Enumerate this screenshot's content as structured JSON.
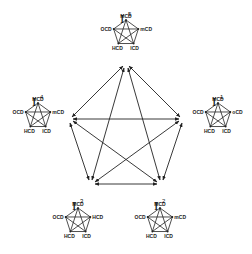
{
  "diagram": {
    "type": "network",
    "colors": {
      "line": "#222222",
      "background": "#ffffff"
    },
    "central_graph": {
      "nodes": [
        "I5",
        "I1",
        "I2",
        "I3",
        "I4"
      ],
      "edges": "all pairs, bidirectional arrows"
    },
    "subgraphs": [
      {
        "id": "I5",
        "title": "I",
        "superscript": "5",
        "labels": {
          "top": "MCD",
          "left": "OCD",
          "right": "mCD",
          "bottom_left": "HCD",
          "bottom_right": "ICD"
        }
      },
      {
        "id": "I4",
        "title": "I",
        "superscript": "4",
        "labels": {
          "top": "MCD",
          "left": "OCD",
          "right": "mCD",
          "bottom_left": "HCD",
          "bottom_right": "ICD"
        }
      },
      {
        "id": "I1",
        "title": "I",
        "superscript": "1",
        "labels": {
          "top": "MCD",
          "left": "OCD",
          "right": "oCD",
          "bottom_left": "HCD",
          "bottom_right": "ICD"
        }
      },
      {
        "id": "I3",
        "title": "I",
        "superscript": "3",
        "labels": {
          "top": "MCD",
          "left": "OCD",
          "right": "HCD",
          "bottom_left": "HCD",
          "bottom_right": "ICD"
        }
      },
      {
        "id": "I2",
        "title": "I",
        "superscript": "2",
        "labels": {
          "top": "MCD",
          "left": "OCD",
          "right": "mCD",
          "bottom_left": "HCD",
          "bottom_right": "ICD"
        }
      }
    ]
  }
}
